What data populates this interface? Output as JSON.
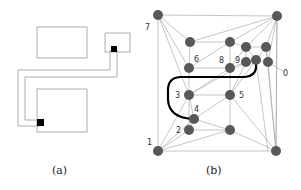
{
  "panel_a": {
    "caption": "(a)",
    "rectangles": [
      {
        "name": "top-left-box",
        "x": 37,
        "y": 27,
        "w": 50,
        "h": 31
      },
      {
        "name": "top-right-box",
        "x": 105,
        "y": 33,
        "w": 25,
        "h": 19
      },
      {
        "name": "bottom-box",
        "x": 37,
        "y": 89,
        "w": 50,
        "h": 43
      }
    ],
    "pins": [
      {
        "name": "pin-top-right",
        "x": 111,
        "y": 46
      },
      {
        "name": "pin-bottom",
        "x": 37,
        "y": 120
      }
    ]
  },
  "panel_b": {
    "caption": "(b)",
    "labels": {
      "n0": "0",
      "n1": "1",
      "n2": "2",
      "n3": "3",
      "n4": "4",
      "n5": "5",
      "n6": "6",
      "n7": "7",
      "n8": "8",
      "n9": "9"
    },
    "colors": {
      "node": "#555555",
      "edge": "#999999",
      "path": "#000000"
    }
  }
}
